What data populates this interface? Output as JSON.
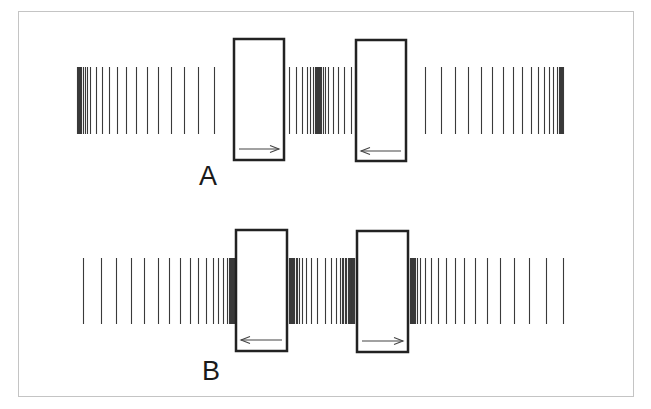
{
  "colors": {
    "line": "#3a3a3a",
    "box": "#222222",
    "frame": "#c4c4c4",
    "arrow": "#444444"
  },
  "rows": [
    {
      "label": "A",
      "label_pos": {
        "x": 199,
        "y": 163
      },
      "line_top": 67,
      "line_bottom": 134,
      "lines": [
        77,
        78,
        79,
        80,
        81,
        83,
        85,
        87,
        90,
        96,
        102,
        109,
        117,
        126,
        136,
        147,
        158,
        171,
        184,
        198,
        214,
        289,
        296,
        302,
        307,
        310,
        313,
        315,
        316,
        317,
        318,
        319,
        320,
        321,
        323,
        325,
        328,
        333,
        338,
        344,
        351,
        425,
        441,
        455,
        468,
        481,
        492,
        503,
        513,
        522,
        531,
        538,
        544,
        549,
        553,
        557,
        559,
        560,
        561,
        562,
        563
      ],
      "boxes": [
        {
          "x": 234,
          "y": 39,
          "w": 50,
          "h": 121,
          "arrow": "right",
          "arrow_y": 149
        },
        {
          "x": 356,
          "y": 40,
          "w": 50,
          "h": 121,
          "arrow": "left",
          "arrow_y": 151
        }
      ]
    },
    {
      "label": "B",
      "label_pos": {
        "x": 202,
        "y": 358
      },
      "line_top": 258,
      "line_bottom": 324,
      "lines": [
        83,
        101,
        116,
        131,
        144,
        158,
        169,
        180,
        190,
        198,
        206,
        213,
        218,
        223,
        227,
        229,
        230,
        231,
        232,
        233,
        234,
        289,
        290,
        291,
        292,
        293,
        294,
        296,
        297,
        299,
        302,
        306,
        311,
        317,
        325,
        331,
        336,
        340,
        343,
        346,
        349,
        351,
        352,
        353,
        354,
        342,
        345,
        348,
        350,
        352,
        353,
        354,
        410,
        411,
        412,
        413,
        414,
        415,
        417,
        420,
        425,
        431,
        438,
        446,
        455,
        464,
        475,
        487,
        500,
        514,
        529,
        546,
        563
      ],
      "boxes": [
        {
          "x": 236,
          "y": 230,
          "w": 51,
          "h": 121,
          "arrow": "left",
          "arrow_y": 340
        },
        {
          "x": 357,
          "y": 231,
          "w": 51,
          "h": 121,
          "arrow": "right",
          "arrow_y": 341
        }
      ]
    }
  ]
}
